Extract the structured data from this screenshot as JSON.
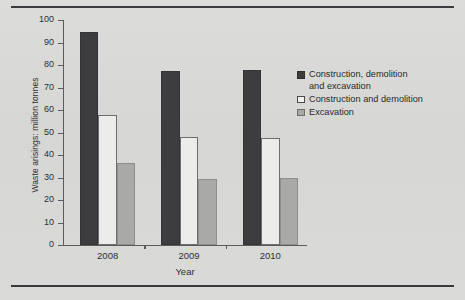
{
  "chart_data": {
    "type": "bar",
    "title": "",
    "subtitle": "",
    "xlabel": "Year",
    "ylabel": "Waste arisings: million tonnes",
    "categories": [
      "2008",
      "2009",
      "2010"
    ],
    "series": [
      {
        "name": "Construction, demolition and excavation",
        "values": [
          94.5,
          77.2,
          77.6
        ],
        "color": "#3d3d3f"
      },
      {
        "name": "Construction and demolition",
        "values": [
          58.0,
          48.0,
          47.5
        ],
        "color": "#ececea"
      },
      {
        "name": "Excavation",
        "values": [
          36.5,
          29.2,
          30.0
        ],
        "color": "#a9a9a7"
      }
    ],
    "ylim": [
      0,
      100
    ],
    "yticks": [
      0,
      10,
      20,
      30,
      40,
      50,
      60,
      70,
      80,
      90,
      100
    ],
    "grid": false,
    "legend_position": "right"
  },
  "legend": {
    "items": [
      {
        "label": "Construction, demolition\nand excavation",
        "swatch": "dark"
      },
      {
        "label": "Construction and demolition",
        "swatch": "white"
      },
      {
        "label": "Excavation",
        "swatch": "gray"
      }
    ]
  },
  "axes": {
    "y_title": "Waste arisings: million tonnes",
    "x_title": "Year",
    "y_tick_labels": [
      "0",
      "10",
      "20",
      "30",
      "40",
      "50",
      "60",
      "70",
      "80",
      "90",
      "100"
    ],
    "x_tick_labels": [
      "2008",
      "2009",
      "2010"
    ]
  },
  "colors": {
    "background": "#d8d8d6",
    "rule": "#3a3a3c",
    "axis": "#5b5b5d",
    "text": "#2f2f31",
    "series_dark": "#3d3d3f",
    "series_white": "#ececea",
    "series_gray": "#a9a9a7"
  }
}
